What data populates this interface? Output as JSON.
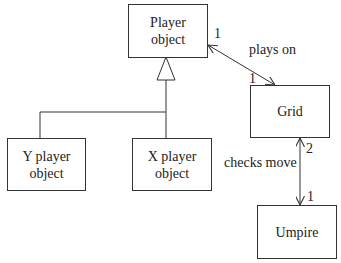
{
  "classes": {
    "player": {
      "line1": "Player",
      "line2": "object"
    },
    "y_player": {
      "line1": "Y player",
      "line2": "object"
    },
    "x_player": {
      "line1": "X player",
      "line2": "object"
    },
    "grid": {
      "line1": "Grid"
    },
    "umpire": {
      "line1": "Umpire"
    }
  },
  "associations": {
    "plays_on": {
      "label": "plays on",
      "mult_player": "1",
      "mult_grid": "1"
    },
    "checks_move": {
      "label": "checks move",
      "mult_grid": "2",
      "mult_umpire": "1"
    }
  },
  "relationships": {
    "inheritance": {
      "parent": "Player object",
      "children": [
        "Y player object",
        "X player object"
      ]
    }
  }
}
